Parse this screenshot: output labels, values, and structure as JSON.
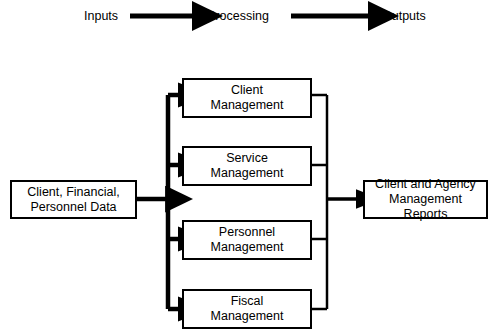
{
  "diagram": {
    "title_row": {
      "inputs_label": "Inputs",
      "processing_label": "Processing",
      "outputs_label": "Outputs",
      "arrow_1": "right-arrow-icon",
      "arrow_2": "right-arrow-icon"
    },
    "input_node": {
      "label": "Client, Financial,\nPersonnel Data"
    },
    "process_nodes": [
      {
        "label": "Client\nManagement"
      },
      {
        "label": "Service\nManagement"
      },
      {
        "label": "Personnel\nManagement"
      },
      {
        "label": "Fiscal\nManagement"
      }
    ],
    "output_node": {
      "label": "Client and Agency\nManagement Reports"
    },
    "colors": {
      "stroke": "#000000",
      "fill": "#ffffff",
      "text": "#000000"
    }
  }
}
